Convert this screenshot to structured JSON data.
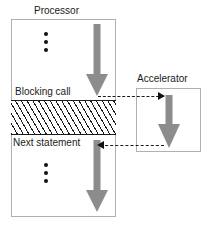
{
  "diagram": {
    "colors": {
      "arrow_gray": "#8c8c8c",
      "box_border": "#b0b0b0",
      "hatch_line": "#1a1a1a",
      "text": "#1a1a1a",
      "background": "#ffffff"
    },
    "processor": {
      "title": "Processor",
      "labels": {
        "blocking_call": "Blocking call",
        "next_statement": "Next statement"
      },
      "ellipsis_top": "•••",
      "ellipsis_bottom": "•••",
      "blocked_region_fill": "diagonal-hatch"
    },
    "accelerator": {
      "title": "Accelerator"
    },
    "connectors": [
      {
        "name": "processor-to-accelerator",
        "style": "dashed",
        "direction": "right",
        "from": "blocking call",
        "to": "accelerator start"
      },
      {
        "name": "accelerator-to-processor",
        "style": "dashed",
        "direction": "left",
        "from": "accelerator end",
        "to": "next statement"
      }
    ],
    "flow_arrows": [
      {
        "name": "processor-execution-before-call",
        "direction": "down",
        "color": "#8c8c8c"
      },
      {
        "name": "processor-execution-after-call",
        "direction": "down",
        "color": "#8c8c8c"
      },
      {
        "name": "accelerator-execution",
        "direction": "down",
        "color": "#8c8c8c"
      }
    ]
  }
}
